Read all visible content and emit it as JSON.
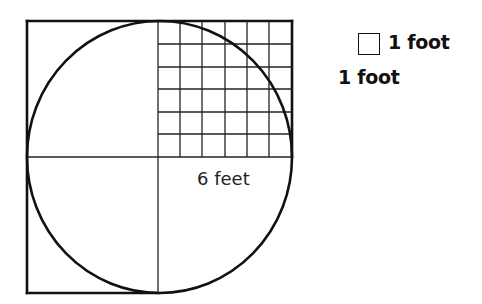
{
  "diagram": {
    "dimension_label": "6 feet",
    "grid": {
      "rows": 6,
      "cols": 6
    },
    "colors": {
      "stroke": "#111111",
      "background": "#ffffff"
    }
  },
  "legend": {
    "unit_box_label": "1 foot",
    "unit_side_label": "1 foot"
  }
}
